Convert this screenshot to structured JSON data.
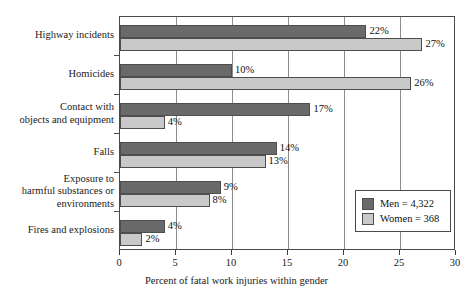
{
  "chart_data": {
    "type": "bar",
    "orientation": "horizontal",
    "title": "",
    "xlabel": "Percent of fatal work injuries within gender",
    "ylabel": "",
    "xlim": [
      0,
      30
    ],
    "xticks": [
      0,
      5,
      10,
      15,
      20,
      25,
      30
    ],
    "xtick_labels": [
      "0",
      "5",
      "10",
      "15",
      "20",
      "25",
      "30"
    ],
    "grid": true,
    "grid_axis": "x",
    "legend_position": "lower right",
    "categories": [
      "Highway incidents",
      "Homicides",
      "Contact with objects and equipment",
      "Falls",
      "Exposure to harmful substances or environments",
      "Fires and explosions"
    ],
    "category_label_lines": [
      [
        "Highway incidents"
      ],
      [
        "Homicides"
      ],
      [
        "Contact with",
        "objects and equipment"
      ],
      [
        "Falls"
      ],
      [
        "Exposure to",
        "harmful substances or",
        "environments"
      ],
      [
        "Fires and explosions"
      ]
    ],
    "series": [
      {
        "name": "Men = 4,322",
        "short_name": "Men",
        "color": "#6a6a6a",
        "values": [
          22,
          10,
          17,
          14,
          9,
          4
        ],
        "data_labels": [
          "22%",
          "10%",
          "17%",
          "14%",
          "9%",
          "4%"
        ]
      },
      {
        "name": "Women = 368",
        "short_name": "Women",
        "color": "#c9c9c9",
        "values": [
          27,
          26,
          4,
          13,
          8,
          2
        ],
        "data_labels": [
          "27%",
          "26%",
          "4%",
          "13%",
          "8%",
          "2%"
        ]
      }
    ]
  },
  "legend": {
    "items": [
      {
        "label": "Men = 4,322",
        "color": "#6a6a6a"
      },
      {
        "label": "Women = 368",
        "color": "#c9c9c9"
      }
    ]
  },
  "axis": {
    "x_title": "Percent of fatal work injuries within gender",
    "x_labels": [
      "0",
      "5",
      "10",
      "15",
      "20",
      "25",
      "30"
    ]
  },
  "colors": {
    "men": "#6a6a6a",
    "women": "#c9c9c9",
    "frame": "#4a4a4a",
    "gridline": "#8d8d8d",
    "background": "#ffffff"
  }
}
